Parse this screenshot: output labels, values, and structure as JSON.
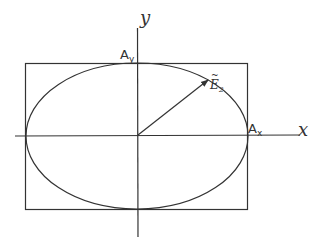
{
  "diagram": {
    "type": "polarization-ellipse",
    "axes": {
      "x_label": "x",
      "y_label": "y"
    },
    "amplitudes": {
      "x_label": "A",
      "x_sub": "x",
      "y_label": "A",
      "y_sub": "y"
    },
    "vector": {
      "label": "E",
      "sub": "2",
      "accent": "~"
    },
    "colors": {
      "line": "#333333",
      "background": "#ffffff"
    }
  }
}
